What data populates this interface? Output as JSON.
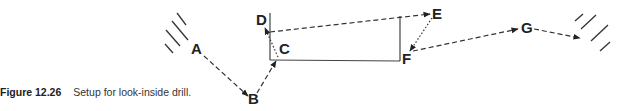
{
  "caption": {
    "number": "Figure 12.26",
    "text": "Setup for look-inside drill."
  },
  "diagram": {
    "points": [
      {
        "label": "A",
        "x": 197,
        "y": 54
      },
      {
        "label": "B",
        "x": 254,
        "y": 104
      },
      {
        "label": "C",
        "x": 284,
        "y": 54
      },
      {
        "label": "D",
        "x": 257,
        "y": 25
      },
      {
        "label": "E",
        "x": 432,
        "y": 19
      },
      {
        "label": "F",
        "x": 403,
        "y": 64
      },
      {
        "label": "G",
        "x": 521,
        "y": 33
      }
    ],
    "paths": [
      {
        "from": "A",
        "to": "B",
        "style": "dashed"
      },
      {
        "from": "B",
        "to": "C",
        "style": "dashed"
      },
      {
        "from": "C",
        "to": "D",
        "style": "dotted"
      },
      {
        "from": "D",
        "to": "E",
        "style": "dashed"
      },
      {
        "from": "E",
        "to": "F",
        "style": "dotted"
      },
      {
        "from": "F",
        "to": "G",
        "style": "dashed"
      },
      {
        "from": "G",
        "to": "exit",
        "style": "dashed"
      }
    ],
    "structure": "room-outline",
    "colors": {
      "ink": "#222222",
      "background": "#ffffff"
    }
  }
}
